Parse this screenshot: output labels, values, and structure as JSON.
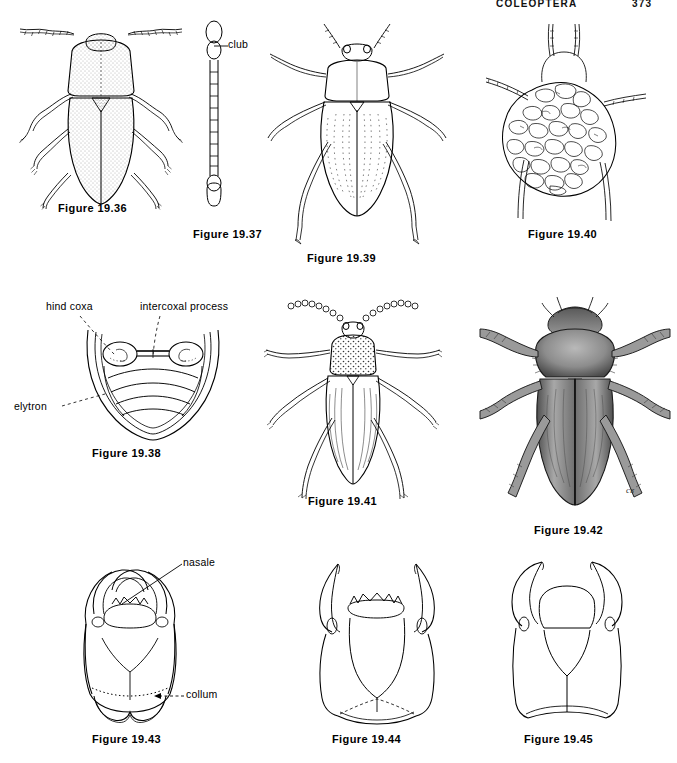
{
  "page": {
    "running_head": "COLEOPTERA",
    "page_number": "373",
    "background_color": "#ffffff",
    "ink_color": "#000000"
  },
  "figures": [
    {
      "id": "19.36",
      "caption": "Figure 19.36",
      "subject": "dorsal habitus of stippled oval beetle with long filiform antennae",
      "annotations": []
    },
    {
      "id": "19.37",
      "caption": "Figure 19.37",
      "subject": "elongate segmented antenna with terminal club",
      "annotations": [
        {
          "label": "club",
          "target": "apical enlarged antennal segments",
          "leader": "solid"
        }
      ]
    },
    {
      "id": "19.38",
      "caption": "Figure 19.38",
      "subject": "ventral view of abdomen showing hind coxae and abdominal sternites",
      "annotations": [
        {
          "label": "hind coxa",
          "target": "left oval coxal cavity",
          "leader": "dashed"
        },
        {
          "label": "intercoxal process",
          "target": "median process between coxae",
          "leader": "dashed"
        },
        {
          "label": "elytron",
          "target": "elytral margin",
          "leader": "dashed"
        }
      ]
    },
    {
      "id": "19.39",
      "caption": "Figure 19.39",
      "subject": "dorsal habitus of beetle with punctate striae and long legs",
      "annotations": []
    },
    {
      "id": "19.40",
      "caption": "Figure 19.40",
      "subject": "larva concealed beneath an irregular debris or fecal shield",
      "annotations": []
    },
    {
      "id": "19.41",
      "caption": "Figure 19.41",
      "subject": "dorsal habitus of slender beetle with punctate pronotum and moniliform antennae",
      "annotations": []
    },
    {
      "id": "19.42",
      "caption": "Figure 19.42",
      "subject": "shaded dorsal habitus of robust scarabaeoid beetle with setose legs",
      "annotations": []
    },
    {
      "id": "19.43",
      "caption": "Figure 19.43",
      "subject": "dorsal view of larval head capsule with nasale and collum",
      "annotations": [
        {
          "label": "nasale",
          "target": "toothed anterior margin of frons",
          "leader": "solid"
        },
        {
          "label": "collum",
          "target": "transverse dotted line at base of head",
          "leader": "dashed"
        }
      ]
    },
    {
      "id": "19.44",
      "caption": "Figure 19.44",
      "subject": "dorsal view of larval head with long curved falcate mandibles",
      "annotations": []
    },
    {
      "id": "19.45",
      "caption": "Figure 19.45",
      "subject": "dorsal view of larval head with stout hooked mandibles",
      "annotations": []
    }
  ]
}
